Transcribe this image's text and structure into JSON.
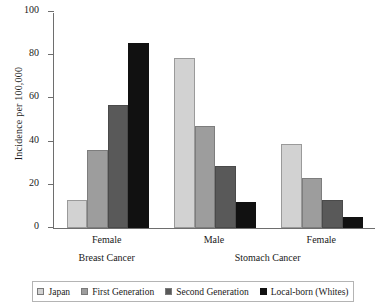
{
  "chart_data": {
    "type": "bar",
    "title": "",
    "xlabel": "",
    "ylabel": "Incidence per 100,000",
    "ylim": [
      0,
      100
    ],
    "yticks": [
      0,
      20,
      40,
      60,
      80,
      100
    ],
    "grid": false,
    "legend_position": "bottom",
    "categories": [
      "Female",
      "Male",
      "Female"
    ],
    "supercategories": [
      {
        "label": "Breast Cancer",
        "spans": [
          0
        ]
      },
      {
        "label": "Stomach Cancer",
        "spans": [
          1,
          2
        ]
      }
    ],
    "series": [
      {
        "name": "Japan",
        "color": "#d2d2d2",
        "values": [
          13,
          78.5,
          39
        ]
      },
      {
        "name": "First Generation",
        "color": "#9d9d9d",
        "values": [
          36,
          47,
          23
        ]
      },
      {
        "name": "Second Generation",
        "color": "#595959",
        "values": [
          57,
          28.5,
          13
        ]
      },
      {
        "name": "Local-born (Whites)",
        "color": "#111111",
        "values": [
          85.5,
          12,
          5
        ]
      }
    ]
  },
  "legend": {
    "items": [
      {
        "label": "Japan"
      },
      {
        "label": "First Generation"
      },
      {
        "label": "Second Generation"
      },
      {
        "label": "Local-born (Whites)"
      }
    ]
  }
}
